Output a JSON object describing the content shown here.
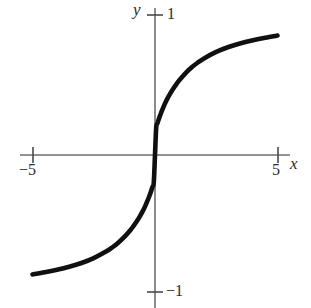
{
  "figure": {
    "background_color": "#ffffff",
    "width": 311,
    "height": 308
  },
  "axes": {
    "x_axis_label": "x",
    "y_axis_label": "y",
    "axis_color": "#6e6e6e",
    "origin_px": {
      "x": 155,
      "y": 155
    },
    "x_axis_extent_px": {
      "start": 20,
      "end": 290
    },
    "y_axis_extent_px": {
      "start": 8,
      "end": 308
    },
    "x_ticks": [
      {
        "value": -5,
        "label": "−5",
        "px": 33
      },
      {
        "value": 5,
        "label": "5",
        "px": 278
      }
    ],
    "y_ticks": [
      {
        "value": 1,
        "label": "1",
        "px": 15
      },
      {
        "value": -1,
        "label": "−1",
        "px": 292
      }
    ]
  },
  "curve": {
    "color": "#101010",
    "stroke_width": 4.6,
    "description": "sigmoid curve through origin approaching y = 1 and y = -1"
  },
  "chart_data": {
    "type": "line",
    "title": "",
    "xlabel": "x",
    "ylabel": "y",
    "xlim": [
      -5.5,
      5.5
    ],
    "ylim": [
      -1.05,
      1.05
    ],
    "grid": false,
    "legend": false,
    "x_ticks": [
      -5,
      5
    ],
    "x_tick_labels": [
      "−5",
      "5"
    ],
    "y_ticks": [
      -1,
      1
    ],
    "y_tick_labels": [
      "−1",
      "1"
    ],
    "series": [
      {
        "name": "y = (2/π) arctan(2x)",
        "color": "#101010",
        "x": [
          -5.0,
          -4.5,
          -4.0,
          -3.5,
          -3.0,
          -2.5,
          -2.0,
          -1.75,
          -1.5,
          -1.25,
          -1.0,
          -0.875,
          -0.75,
          -0.625,
          -0.5,
          -0.4,
          -0.3,
          -0.25,
          -0.2,
          -0.15,
          -0.1,
          -0.05,
          0.0,
          0.05,
          0.1,
          0.15,
          0.2,
          0.25,
          0.3,
          0.4,
          0.5,
          0.625,
          0.75,
          0.875,
          1.0,
          1.25,
          1.5,
          1.75,
          2.0,
          2.5,
          3.0,
          3.5,
          4.0,
          4.5,
          5.0
        ],
        "y": [
          -0.8626,
          -0.8474,
          -0.8293,
          -0.8072,
          -0.7796,
          -0.7442,
          -0.6974,
          -0.6679,
          -0.633,
          -0.5913,
          -0.5411,
          -0.5124,
          -0.4805,
          -0.445,
          -0.4056,
          -0.369,
          -0.3274,
          -0.305,
          -0.2811,
          -0.2557,
          -0.2285,
          -0.1994,
          0.0,
          0.1994,
          0.2285,
          0.2557,
          0.2811,
          0.305,
          0.3274,
          0.369,
          0.4056,
          0.445,
          0.4805,
          0.5124,
          0.5411,
          0.5913,
          0.633,
          0.6679,
          0.6974,
          0.7442,
          0.7796,
          0.8072,
          0.8293,
          0.8474,
          0.8626
        ]
      }
    ]
  }
}
